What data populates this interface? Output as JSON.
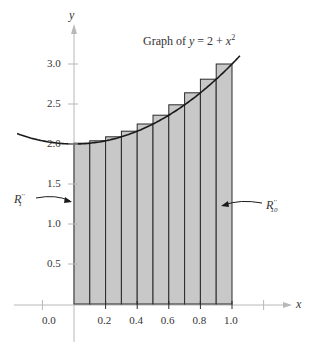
{
  "chart_data": {
    "type": "bar",
    "function": "y = 2 + x^2",
    "xlabel": "x",
    "ylabel": "y",
    "xlim": [
      -0.36,
      1.4
    ],
    "ylim": [
      -0.45,
      3.5
    ],
    "x_ticks": [
      "0.0",
      "0.2",
      "0.4",
      "0.6",
      "0.8",
      "1.0"
    ],
    "y_ticks": [
      "0.5",
      "1.0",
      "1.5",
      "2.0",
      "2.5",
      "3.0"
    ],
    "grid": false,
    "categories": [
      "0.0–0.1",
      "0.1–0.2",
      "0.2–0.3",
      "0.3–0.4",
      "0.4–0.5",
      "0.5–0.6",
      "0.6–0.7",
      "0.7–0.8",
      "0.8–0.9",
      "0.9–1.0"
    ],
    "bar_left_edges": [
      0.0,
      0.1,
      0.2,
      0.3,
      0.4,
      0.5,
      0.6,
      0.7,
      0.8,
      0.9
    ],
    "bar_width": 0.1,
    "values": [
      2.01,
      2.04,
      2.09,
      2.16,
      2.25,
      2.36,
      2.49,
      2.64,
      2.81,
      3.0
    ],
    "annotations": [
      {
        "text": "R''1",
        "points_to": "first rectangle"
      },
      {
        "text": "R''10",
        "points_to": "last rectangle"
      }
    ]
  },
  "labels": {
    "title_prefix": "Graph of ",
    "title_y": "y",
    "title_eq": " = 2 + ",
    "title_x": "x",
    "title_exp": "2",
    "xlabel": "x",
    "ylabel": "y",
    "r_first_main": "R",
    "r_first_sup": "′′",
    "r_first_sub": "1",
    "r_last_main": "R",
    "r_last_sup": "′′",
    "r_last_sub": "10",
    "origin": "0.0"
  },
  "colors": {
    "bar_fill": "#c8c8c8",
    "bar_stroke": "#2a2a2a",
    "axis": "#b8b8b8",
    "curve": "#1a1a1a"
  }
}
